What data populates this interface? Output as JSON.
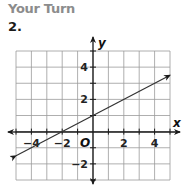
{
  "header": {
    "title": "Your Turn",
    "problem_number": "2."
  },
  "colors": {
    "heading": "#8c8c8c",
    "grid": "#9a9a9a",
    "axis": "#1a1a1a",
    "line": "#333333"
  },
  "chart_data": {
    "type": "line",
    "title": "",
    "xlabel": "x",
    "ylabel": "y",
    "origin_label": "O",
    "xlim": [
      -5,
      5
    ],
    "ylim": [
      -3,
      5
    ],
    "grid": true,
    "x_ticks": [
      -4,
      -2,
      2,
      4
    ],
    "y_ticks": [
      4,
      2,
      -2
    ],
    "x_tick_labels": [
      "−4",
      "−2",
      "2",
      "4"
    ],
    "y_tick_labels": [
      "4",
      "2",
      "−2"
    ],
    "series": [
      {
        "name": "line",
        "equation": "y = 0.5x + 1",
        "x": [
          -5,
          -2,
          0,
          5
        ],
        "y": [
          -1.5,
          0,
          1,
          3.5
        ],
        "arrows": "both"
      }
    ]
  }
}
